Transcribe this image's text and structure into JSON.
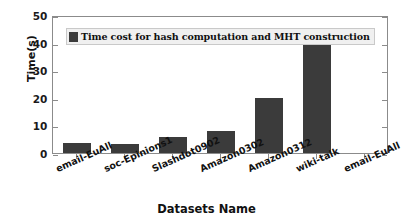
{
  "chart_data": {
    "type": "bar",
    "title": "",
    "xlabel": "Datasets Name",
    "ylabel": "Time(s)",
    "categories": [
      "email-EuAll",
      "soc-Epinions1",
      "Slashdot0902",
      "Amazon0302",
      "Amazon0312",
      "wiki-talk",
      "email-EuAll"
    ],
    "values": [
      3.6,
      3.3,
      5.8,
      8.0,
      20.0,
      44.3,
      null
    ],
    "series": [
      {
        "name": "Time cost for hash computation and MHT construction",
        "values": [
          3.6,
          3.3,
          5.8,
          8.0,
          20.0,
          44.3,
          null
        ]
      }
    ],
    "ylim": [
      0,
      50
    ],
    "yticks": [
      0,
      10,
      20,
      30,
      40,
      50
    ],
    "ytick_labels": [
      "0",
      "10",
      "20",
      "30",
      "40",
      "50"
    ],
    "grid": false,
    "legend": {
      "position": "upper-left-inside",
      "entries": [
        "Time cost for hash computation and MHT construction"
      ]
    },
    "bar_color": "#3b3b3b",
    "frame_color": "#8b8b8b",
    "background": "#ffffff"
  },
  "axes": {
    "y_label": "Time(s)",
    "x_label": "Datasets Name",
    "y_ticks": [
      "0",
      "10",
      "20",
      "30",
      "40",
      "50"
    ],
    "x_ticks": [
      "email-EuAll",
      "soc-Epinions1",
      "Slashdot0902",
      "Amazon0302",
      "Amazon0312",
      "wiki-talk",
      "email-EuAll"
    ]
  },
  "legend": {
    "label": "Time cost for hash computation and MHT construction",
    "swatch_color": "#3b3b3b"
  }
}
